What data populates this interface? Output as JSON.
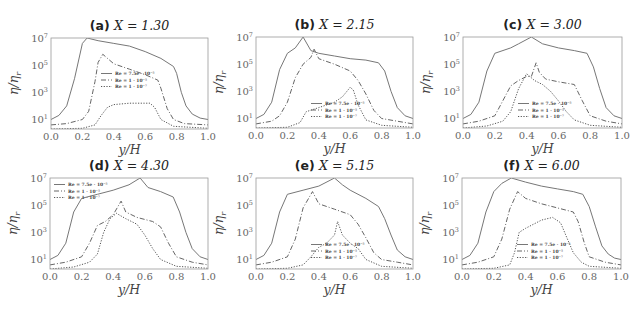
{
  "chart_data": [
    {
      "type": "line",
      "panel": "a",
      "title": "(a) X = 1.30",
      "title_label": "(a)",
      "title_var": "X = 1.30",
      "xlabel": "y/H",
      "ylabel": "η/η_r",
      "yscale": "log",
      "xlim": [
        0.0,
        1.0
      ],
      "ylim_log10": [
        0.3,
        7
      ],
      "xticks": [
        "0.0",
        "0.2",
        "0.4",
        "0.6",
        "0.8",
        "1.0"
      ],
      "yticks": [
        "10^1",
        "10^3",
        "10^5",
        "10^7"
      ],
      "legend_position": "center",
      "legend": [
        "Re = 7.5e · 10^-5",
        "Re = 1 · 10^-5",
        "Re = 1 · 10^-7"
      ],
      "series": [
        {
          "name": "Re = 7.5e · 10^-5",
          "style": "solid",
          "x": [
            0.0,
            0.05,
            0.1,
            0.15,
            0.2,
            0.23,
            0.3,
            0.4,
            0.5,
            0.6,
            0.7,
            0.78,
            0.8,
            0.83,
            0.86,
            0.9,
            0.95,
            1.0
          ],
          "log10_y": [
            1.0,
            1.3,
            2.0,
            4.0,
            6.6,
            7.0,
            6.8,
            6.6,
            6.4,
            6.0,
            5.5,
            4.9,
            4.4,
            3.0,
            2.0,
            1.4,
            1.1,
            1.0
          ]
        },
        {
          "name": "Re = 1 · 10^-5",
          "style": "dashdot",
          "x": [
            0.0,
            0.1,
            0.2,
            0.24,
            0.28,
            0.3,
            0.33,
            0.4,
            0.5,
            0.6,
            0.68,
            0.7,
            0.74,
            0.78,
            0.85,
            1.0
          ],
          "log10_y": [
            0.6,
            0.7,
            1.0,
            1.6,
            3.8,
            5.2,
            5.8,
            5.1,
            4.7,
            4.3,
            3.9,
            3.3,
            1.8,
            1.0,
            0.7,
            0.6
          ]
        },
        {
          "name": "Re = 1 · 10^-7",
          "style": "dotted",
          "x": [
            0.0,
            0.2,
            0.28,
            0.32,
            0.36,
            0.4,
            0.5,
            0.6,
            0.63,
            0.66,
            0.7,
            0.78,
            1.0
          ],
          "log10_y": [
            0.3,
            0.35,
            0.6,
            1.3,
            1.9,
            2.1,
            2.2,
            2.2,
            2.2,
            1.9,
            1.0,
            0.5,
            0.35
          ]
        }
      ]
    },
    {
      "type": "line",
      "panel": "b",
      "title": "(b) X = 2.15",
      "title_label": "(b)",
      "title_var": "X = 2.15",
      "xlabel": "y/H",
      "ylabel": "η/η_r",
      "yscale": "log",
      "xlim": [
        0.0,
        1.0
      ],
      "ylim_log10": [
        0.3,
        7
      ],
      "xticks": [
        "0.0",
        "0.2",
        "0.4",
        "0.6",
        "0.8",
        "1.0"
      ],
      "yticks": [
        "10^1",
        "10^3",
        "10^5",
        "10^7"
      ],
      "legend_position": "lower center",
      "legend": [
        "Re = 7.5e · 10^-5",
        "Re = 1 · 10^-5",
        "Re = 1 · 10^-7"
      ],
      "series": [
        {
          "name": "Re = 7.5e · 10^-5",
          "style": "solid",
          "x": [
            0.0,
            0.05,
            0.1,
            0.15,
            0.2,
            0.25,
            0.3,
            0.35,
            0.4,
            0.5,
            0.6,
            0.7,
            0.78,
            0.82,
            0.86,
            0.9,
            0.95,
            1.0
          ],
          "log10_y": [
            1.0,
            1.3,
            2.2,
            4.6,
            5.8,
            6.2,
            7.0,
            6.0,
            5.8,
            5.6,
            5.4,
            5.3,
            5.1,
            4.5,
            3.0,
            1.8,
            1.2,
            1.0
          ]
        },
        {
          "name": "Re = 1 · 10^-5",
          "style": "dashdot",
          "x": [
            0.0,
            0.1,
            0.15,
            0.2,
            0.25,
            0.3,
            0.35,
            0.37,
            0.4,
            0.5,
            0.6,
            0.65,
            0.7,
            0.75,
            0.8,
            0.9,
            1.0
          ],
          "log10_y": [
            0.6,
            0.8,
            1.2,
            2.2,
            4.0,
            5.0,
            5.5,
            6.1,
            5.4,
            5.0,
            4.5,
            3.8,
            2.8,
            1.6,
            1.0,
            0.8,
            0.6
          ]
        },
        {
          "name": "Re = 1 · 10^-7",
          "style": "dotted",
          "x": [
            0.0,
            0.2,
            0.28,
            0.32,
            0.4,
            0.5,
            0.55,
            0.6,
            0.62,
            0.65,
            0.7,
            0.8,
            1.0
          ],
          "log10_y": [
            0.3,
            0.35,
            0.7,
            1.5,
            1.8,
            2.2,
            2.6,
            3.3,
            3.1,
            2.0,
            0.9,
            0.5,
            0.35
          ]
        }
      ]
    },
    {
      "type": "line",
      "panel": "c",
      "title": "(c) X = 3.00",
      "title_label": "(c)",
      "title_var": "X = 3.00",
      "xlabel": "y/H",
      "ylabel": "η/η_r",
      "yscale": "log",
      "xlim": [
        0.0,
        1.0
      ],
      "ylim_log10": [
        0.3,
        7
      ],
      "xticks": [
        "0.0",
        "0.2",
        "0.4",
        "0.6",
        "0.8",
        "1.0"
      ],
      "yticks": [
        "10^1",
        "10^3",
        "10^5",
        "10^7"
      ],
      "legend_position": "lower center",
      "legend": [
        "Re = 7.5e · 10^-5",
        "Re = 1 · 10^-5",
        "Re = 1 · 10^-7"
      ],
      "series": [
        {
          "name": "Re = 7.5e · 10^-5",
          "style": "solid",
          "x": [
            0.0,
            0.05,
            0.1,
            0.15,
            0.2,
            0.3,
            0.35,
            0.43,
            0.5,
            0.6,
            0.7,
            0.78,
            0.82,
            0.86,
            0.9,
            0.95,
            1.0
          ],
          "log10_y": [
            1.0,
            1.3,
            2.2,
            4.5,
            5.8,
            6.2,
            6.5,
            7.0,
            6.5,
            6.2,
            6.0,
            5.8,
            4.8,
            3.2,
            1.8,
            1.2,
            1.0
          ]
        },
        {
          "name": "Re = 1 · 10^-5",
          "style": "dashdot",
          "x": [
            0.0,
            0.1,
            0.2,
            0.25,
            0.3,
            0.35,
            0.4,
            0.43,
            0.46,
            0.48,
            0.52,
            0.6,
            0.7,
            0.75,
            0.8,
            0.9,
            1.0
          ],
          "log10_y": [
            0.6,
            0.8,
            1.2,
            2.3,
            3.4,
            3.8,
            4.1,
            4.1,
            5.1,
            4.4,
            3.9,
            3.7,
            3.5,
            2.3,
            1.2,
            0.8,
            0.6
          ]
        },
        {
          "name": "Re = 1 · 10^-7",
          "style": "dotted",
          "x": [
            0.0,
            0.15,
            0.25,
            0.3,
            0.35,
            0.4,
            0.45,
            0.5,
            0.55,
            0.6,
            0.65,
            0.7,
            0.8,
            1.0
          ],
          "log10_y": [
            0.3,
            0.45,
            0.8,
            1.5,
            3.2,
            4.3,
            3.8,
            3.5,
            3.0,
            2.3,
            1.5,
            0.9,
            0.5,
            0.35
          ]
        }
      ]
    },
    {
      "type": "line",
      "panel": "d",
      "title": "(d) X = 4.30",
      "title_label": "(d)",
      "title_var": "X = 4.30",
      "xlabel": "y/H",
      "ylabel": "η/η_r",
      "yscale": "log",
      "xlim": [
        0.0,
        1.0
      ],
      "ylim_log10": [
        0.3,
        7
      ],
      "xticks": [
        "0.0",
        "0.2",
        "0.4",
        "0.6",
        "0.8",
        "1.0"
      ],
      "yticks": [
        "10^1",
        "10^3",
        "10^5",
        "10^7"
      ],
      "legend_position": "upper left",
      "legend": [
        "Re = 7.5e · 10^-5",
        "Re = 1 · 10^-5",
        "Re = 1 · 10^-7"
      ],
      "series": [
        {
          "name": "Re = 7.5e · 10^-5",
          "style": "solid",
          "x": [
            0.0,
            0.05,
            0.1,
            0.15,
            0.2,
            0.3,
            0.4,
            0.5,
            0.57,
            0.62,
            0.7,
            0.78,
            0.82,
            0.86,
            0.9,
            0.95,
            1.0
          ],
          "log10_y": [
            1.0,
            1.3,
            2.2,
            4.5,
            5.5,
            5.8,
            6.1,
            6.5,
            7.0,
            6.3,
            6.0,
            5.6,
            4.5,
            3.0,
            1.8,
            1.2,
            1.0
          ]
        },
        {
          "name": "Re = 1 · 10^-5",
          "style": "dashdot",
          "x": [
            0.0,
            0.1,
            0.2,
            0.25,
            0.3,
            0.35,
            0.4,
            0.45,
            0.48,
            0.55,
            0.65,
            0.7,
            0.75,
            0.8,
            0.9,
            1.0
          ],
          "log10_y": [
            0.6,
            0.8,
            1.2,
            2.2,
            3.5,
            3.8,
            4.3,
            5.3,
            4.5,
            4.1,
            3.8,
            3.4,
            2.2,
            1.2,
            0.8,
            0.6
          ]
        },
        {
          "name": "Re = 1 · 10^-7",
          "style": "dotted",
          "x": [
            0.0,
            0.15,
            0.25,
            0.3,
            0.34,
            0.38,
            0.42,
            0.48,
            0.55,
            0.6,
            0.65,
            0.7,
            0.8,
            1.0
          ],
          "log10_y": [
            0.3,
            0.45,
            0.8,
            1.4,
            3.0,
            4.0,
            4.4,
            4.0,
            3.6,
            2.8,
            1.8,
            1.0,
            0.5,
            0.35
          ]
        }
      ]
    },
    {
      "type": "line",
      "panel": "e",
      "title": "(e) X = 5.15",
      "title_label": "(e)",
      "title_var": "X = 5.15",
      "xlabel": "y/H",
      "ylabel": "η/η_r",
      "yscale": "log",
      "xlim": [
        0.0,
        1.0
      ],
      "ylim_log10": [
        0.3,
        7
      ],
      "xticks": [
        "0.0",
        "0.2",
        "0.4",
        "0.6",
        "0.8",
        "1.0"
      ],
      "yticks": [
        "10^1",
        "10^3",
        "10^5",
        "10^7"
      ],
      "legend_position": "lower center",
      "legend": [
        "Re = 7.5e · 10^-5",
        "Re = 1 · 10^-5",
        "Re = 1 · 10^-7"
      ],
      "series": [
        {
          "name": "Re = 7.5e · 10^-5",
          "style": "solid",
          "x": [
            0.0,
            0.05,
            0.1,
            0.15,
            0.2,
            0.3,
            0.4,
            0.5,
            0.55,
            0.6,
            0.7,
            0.78,
            0.82,
            0.86,
            0.9,
            0.95,
            1.0
          ],
          "log10_y": [
            1.0,
            1.3,
            2.2,
            4.5,
            5.8,
            6.1,
            6.4,
            7.0,
            6.5,
            6.1,
            5.5,
            4.9,
            4.0,
            2.8,
            1.7,
            1.2,
            1.0
          ]
        },
        {
          "name": "Re = 1 · 10^-5",
          "style": "dashdot",
          "x": [
            0.0,
            0.1,
            0.2,
            0.25,
            0.3,
            0.36,
            0.4,
            0.5,
            0.6,
            0.65,
            0.7,
            0.75,
            0.8,
            0.9,
            1.0
          ],
          "log10_y": [
            0.6,
            0.8,
            1.2,
            2.5,
            4.8,
            6.0,
            5.1,
            4.7,
            4.3,
            3.6,
            2.6,
            1.5,
            1.0,
            0.8,
            0.6
          ]
        },
        {
          "name": "Re = 1 · 10^-7",
          "style": "dotted",
          "x": [
            0.0,
            0.2,
            0.3,
            0.35,
            0.4,
            0.45,
            0.5,
            0.52,
            0.55,
            0.6,
            0.65,
            0.7,
            0.8,
            1.0
          ],
          "log10_y": [
            0.3,
            0.35,
            0.6,
            1.2,
            1.9,
            2.2,
            2.8,
            3.8,
            2.8,
            2.2,
            1.8,
            1.0,
            0.5,
            0.35
          ]
        }
      ]
    },
    {
      "type": "line",
      "panel": "f",
      "title": "(f) X = 6.00",
      "title_label": "(f)",
      "title_var": "X = 6.00",
      "xlabel": "y/H",
      "ylabel": "η/η_r",
      "yscale": "log",
      "xlim": [
        0.0,
        1.0
      ],
      "ylim_log10": [
        0.3,
        7
      ],
      "xticks": [
        "0.0",
        "0.2",
        "0.4",
        "0.6",
        "0.8",
        "1.0"
      ],
      "yticks": [
        "10^1",
        "10^3",
        "10^5",
        "10^7"
      ],
      "legend_position": "lower center",
      "legend": [
        "Re = 7.5e · 10^-5",
        "Re = 1 · 10^-5",
        "Re = 1 · 10^-7"
      ],
      "series": [
        {
          "name": "Re = 7.5e · 10^-5",
          "style": "solid",
          "x": [
            0.0,
            0.05,
            0.1,
            0.15,
            0.2,
            0.25,
            0.31,
            0.4,
            0.5,
            0.6,
            0.7,
            0.76,
            0.8,
            0.84,
            0.88,
            0.92,
            0.96,
            1.0
          ],
          "log10_y": [
            1.0,
            1.3,
            2.2,
            4.5,
            6.0,
            6.6,
            7.0,
            6.7,
            6.4,
            6.2,
            6.0,
            5.8,
            4.9,
            3.4,
            2.0,
            1.4,
            1.1,
            1.0
          ]
        },
        {
          "name": "Re = 1 · 10^-5",
          "style": "dashdot",
          "x": [
            0.0,
            0.1,
            0.2,
            0.25,
            0.3,
            0.35,
            0.4,
            0.5,
            0.6,
            0.7,
            0.73,
            0.77,
            0.8,
            0.9,
            1.0
          ],
          "log10_y": [
            0.6,
            0.8,
            1.2,
            2.5,
            4.7,
            6.0,
            5.5,
            5.1,
            4.8,
            4.5,
            3.8,
            2.2,
            1.2,
            0.8,
            0.6
          ]
        },
        {
          "name": "Re = 1 · 10^-7",
          "style": "dotted",
          "x": [
            0.0,
            0.2,
            0.3,
            0.33,
            0.36,
            0.4,
            0.5,
            0.57,
            0.62,
            0.66,
            0.7,
            0.75,
            0.8,
            1.0
          ],
          "log10_y": [
            0.3,
            0.35,
            0.6,
            1.5,
            3.0,
            3.3,
            3.9,
            4.1,
            3.7,
            2.6,
            1.5,
            0.8,
            0.5,
            0.35
          ]
        }
      ]
    }
  ]
}
